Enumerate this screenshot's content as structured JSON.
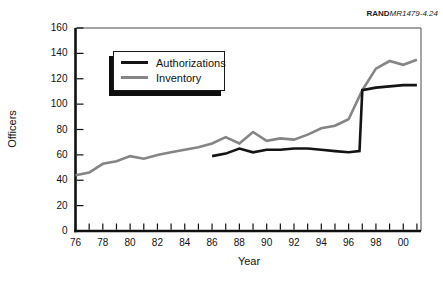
{
  "branding": {
    "publisher": "RAND",
    "figure_ref": "MR1479-4.24"
  },
  "chart_data": {
    "type": "line",
    "title": "",
    "xlabel": "Year",
    "ylabel": "Officers",
    "grid": false,
    "legend_position": "upper-left-inside",
    "x_axis": {
      "min": 1976,
      "max": 2001.3,
      "minor_tick_step_years": 1,
      "tick_years": [
        1976,
        1977,
        1978,
        1979,
        1980,
        1981,
        1982,
        1983,
        1984,
        1985,
        1986,
        1987,
        1988,
        1989,
        1990,
        1991,
        1992,
        1993,
        1994,
        1995,
        1996,
        1997,
        1998,
        1999,
        2000,
        2001
      ],
      "major_labels": [
        {
          "year": 1976,
          "label": "76"
        },
        {
          "year": 1978,
          "label": "78"
        },
        {
          "year": 1980,
          "label": "80"
        },
        {
          "year": 1982,
          "label": "82"
        },
        {
          "year": 1984,
          "label": "84"
        },
        {
          "year": 1986,
          "label": "86"
        },
        {
          "year": 1988,
          "label": "88"
        },
        {
          "year": 1990,
          "label": "90"
        },
        {
          "year": 1992,
          "label": "92"
        },
        {
          "year": 1994,
          "label": "94"
        },
        {
          "year": 1996,
          "label": "96"
        },
        {
          "year": 1998,
          "label": "98"
        },
        {
          "year": 2000,
          "label": "00"
        }
      ]
    },
    "y_axis": {
      "min": 0,
      "max": 160,
      "ticks": [
        0,
        20,
        40,
        60,
        80,
        100,
        120,
        140,
        160
      ]
    },
    "series": [
      {
        "name": "Inventory",
        "color": "#858585",
        "line_width": 2.6,
        "x": [
          1976,
          1977,
          1978,
          1979,
          1980,
          1981,
          1982,
          1983,
          1984,
          1985,
          1986,
          1987,
          1988,
          1989,
          1990,
          1991,
          1992,
          1993,
          1994,
          1995,
          1996,
          1997,
          1998,
          1999,
          2000,
          2001
        ],
        "values": [
          44,
          46,
          53,
          55,
          59,
          57,
          60,
          62,
          64,
          66,
          69,
          74,
          69,
          78,
          71,
          73,
          72,
          76,
          81,
          83,
          88,
          111,
          128,
          134,
          131,
          135
        ]
      },
      {
        "name": "Authorizations",
        "color": "#141414",
        "line_width": 2.6,
        "x": [
          1986,
          1987,
          1988,
          1989,
          1990,
          1991,
          1992,
          1993,
          1994,
          1995,
          1996,
          1996.8,
          1997,
          1998,
          1999,
          2000,
          2001
        ],
        "values": [
          59,
          61,
          65,
          62,
          64,
          64,
          65,
          65,
          64,
          63,
          62,
          63,
          111,
          113,
          114,
          115,
          115
        ]
      }
    ],
    "legend_order": [
      "Authorizations",
      "Inventory"
    ],
    "frame_color": "#4a4a4a",
    "axis_color": "#111111"
  }
}
